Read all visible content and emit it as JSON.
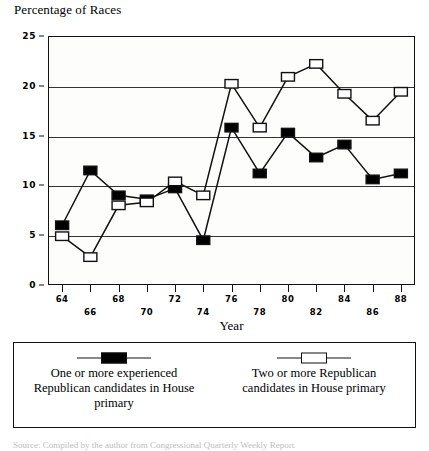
{
  "chart_data": {
    "type": "line",
    "title": "Percentage of Races",
    "xlabel": "Year",
    "ylabel": "",
    "x": [
      64,
      66,
      68,
      70,
      72,
      74,
      76,
      78,
      80,
      82,
      84,
      86,
      88
    ],
    "categories": [
      "64",
      "66",
      "68",
      "70",
      "72",
      "74",
      "76",
      "78",
      "80",
      "82",
      "84",
      "86",
      "88"
    ],
    "xlim": [
      63,
      89
    ],
    "ylim": [
      0,
      25
    ],
    "yticks": [
      0,
      5,
      10,
      15,
      20,
      25
    ],
    "ytick_labels": [
      "0",
      "5",
      "10",
      "15",
      "20",
      "25"
    ],
    "grid": true,
    "grid_axis": "y",
    "legend_position": "below",
    "series": [
      {
        "name": "One or more experienced Republican candidates in House primary",
        "marker": "filled-square",
        "color": "#000000",
        "values": [
          6.0,
          11.5,
          9.0,
          8.6,
          9.7,
          4.5,
          15.8,
          11.2,
          15.3,
          12.8,
          14.1,
          10.6,
          11.2
        ]
      },
      {
        "name": "Two or more Republican candidates in House primary",
        "marker": "open-square",
        "color": "#ffffff",
        "values": [
          4.9,
          2.8,
          8.0,
          8.3,
          10.4,
          9.0,
          20.2,
          15.8,
          20.9,
          22.2,
          19.2,
          16.5,
          19.4
        ]
      }
    ]
  },
  "legend": {
    "entries": [
      {
        "marker": "filled-square",
        "lines": [
          "One or more experienced",
          "Republican candidates in House",
          "primary"
        ]
      },
      {
        "marker": "open-square",
        "lines": [
          "Two or more Republican",
          "candidates in House primary"
        ]
      }
    ]
  },
  "source_note": "Source:  Compiled by the author from Congressional Quarterly Weekly Report"
}
